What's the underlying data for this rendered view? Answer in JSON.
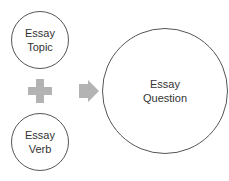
{
  "diagram": {
    "nodes": [
      {
        "id": "topic",
        "label": "Essay\nTopic"
      },
      {
        "id": "verb",
        "label": "Essay\nVerb"
      },
      {
        "id": "question",
        "label": "Essay\nQuestion"
      }
    ],
    "operators": {
      "combine": "plus-icon",
      "result": "arrow-right-icon"
    },
    "colors": {
      "stroke": "#555555",
      "text": "#333333",
      "operator_fill": "#b3b3b3"
    }
  }
}
